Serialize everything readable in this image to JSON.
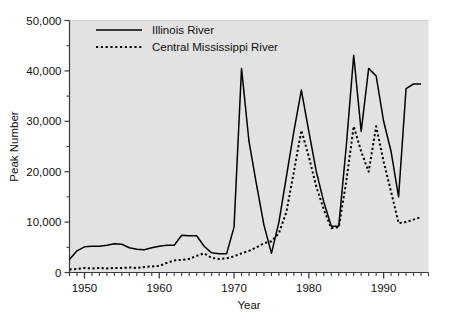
{
  "chart_data": {
    "type": "line",
    "title": "",
    "xlabel": "Year",
    "ylabel": "Peak Number",
    "xlim": [
      1948,
      1996
    ],
    "ylim": [
      0,
      50000
    ],
    "grid": false,
    "legend_position": "top-left-inside",
    "x_tick_labels": [
      "1950",
      "1960",
      "1970",
      "1980",
      "1990"
    ],
    "x_tick_values": [
      1950,
      1960,
      1970,
      1980,
      1990
    ],
    "x_minor_tick_step": 1,
    "y_tick_labels": [
      "0",
      "10,000",
      "20,000",
      "30,000",
      "40,000",
      "50,000"
    ],
    "y_tick_values": [
      0,
      10000,
      20000,
      30000,
      40000,
      50000
    ],
    "y_minor_tick_step": 5000,
    "x": [
      1948,
      1949,
      1950,
      1951,
      1952,
      1953,
      1954,
      1955,
      1956,
      1957,
      1958,
      1959,
      1960,
      1961,
      1962,
      1963,
      1964,
      1965,
      1966,
      1967,
      1968,
      1969,
      1970,
      1971,
      1972,
      1973,
      1974,
      1975,
      1976,
      1977,
      1978,
      1979,
      1980,
      1981,
      1982,
      1983,
      1984,
      1985,
      1986,
      1987,
      1988,
      1989,
      1990,
      1991,
      1992,
      1993,
      1994,
      1995
    ],
    "series": [
      {
        "name": "Illinois River",
        "style": "solid",
        "color": "#000000",
        "values": [
          2600,
          4300,
          5100,
          5200,
          5200,
          5400,
          5700,
          5600,
          4900,
          4600,
          4500,
          4900,
          5200,
          5400,
          5400,
          7400,
          7300,
          7300,
          5200,
          3900,
          3700,
          3700,
          9000,
          40500,
          26000,
          17500,
          9400,
          3800,
          10000,
          19000,
          28000,
          36200,
          28000,
          20000,
          14000,
          9200,
          9200,
          25000,
          43100,
          28000,
          40500,
          39000,
          30000,
          24000,
          15000,
          36500,
          37400,
          37400
        ],
        "annotations": [
          {
            "year": 1971,
            "value": 40500,
            "note": "first major peak"
          },
          {
            "year": 1979,
            "value": 36200,
            "note": "second major peak"
          },
          {
            "year": 1986,
            "value": 43100,
            "note": "highest peak"
          },
          {
            "year": 1988,
            "value": 40500,
            "note": "late 1980s peak"
          }
        ]
      },
      {
        "name": "Central Mississippi River",
        "style": "dotted",
        "color": "#000000",
        "values": [
          600,
          700,
          900,
          800,
          900,
          800,
          900,
          900,
          1000,
          900,
          1100,
          1200,
          1300,
          1900,
          2400,
          2500,
          2700,
          3300,
          3800,
          2900,
          2700,
          2800,
          3200,
          3800,
          4300,
          5000,
          5800,
          6200,
          7800,
          12000,
          20000,
          28200,
          23000,
          17000,
          12500,
          8800,
          9000,
          18000,
          29000,
          24000,
          20000,
          29000,
          22000,
          16000,
          9800,
          10000,
          10500,
          11000
        ],
        "annotations": [
          {
            "year": 1979,
            "value": 28200,
            "note": "peak"
          },
          {
            "year": 1986,
            "value": 29000,
            "note": "peak"
          },
          {
            "year": 1989,
            "value": 29000,
            "note": "peak"
          }
        ]
      }
    ]
  },
  "legend": {
    "items": [
      {
        "label": "Illinois River",
        "style": "solid"
      },
      {
        "label": "Central Mississippi River",
        "style": "dotted"
      }
    ]
  },
  "axes": {
    "x_title": "Year",
    "y_title": "Peak Number"
  },
  "colors": {
    "plot_background": "#e2e2e2",
    "figure_background": "#ffffff",
    "line": "#000000",
    "axis": "#3a3a3a",
    "text": "#111111"
  }
}
